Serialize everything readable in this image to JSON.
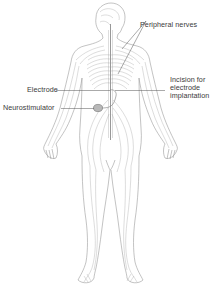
{
  "diagram": {
    "labels": {
      "peripheral_nerves": "Peripheral nerves",
      "electrode": "Electrode",
      "neurostimulator": "Neurostimulator",
      "incision_line1": "Incision for",
      "incision_line2": "electrode",
      "incision_line3": "implantation"
    },
    "colors": {
      "outline": "#9a9a9a",
      "nerve": "#a8a8a8",
      "spine": "#8c8c8c",
      "device": "#7a7a7a",
      "leader": "#555555",
      "text": "#3a3a3a",
      "background": "#ffffff"
    }
  }
}
